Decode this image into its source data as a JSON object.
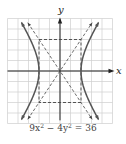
{
  "chart_data": {
    "type": "line",
    "title": "",
    "caption": "9x² − 4y² = 36",
    "caption_parts": {
      "a": "9x",
      "sup1": "2",
      "b": " − 4y",
      "sup2": "2",
      "c": " = 36"
    },
    "xlabel": "x",
    "ylabel": "y",
    "xlim": [
      -5,
      5
    ],
    "ylim": [
      -5,
      5
    ],
    "grid": true,
    "grid_step": 1,
    "series": [
      {
        "name": "hyperbola right branch",
        "style": "solid",
        "equation": "x^2/4 - y^2/9 = 1, x>0",
        "vertex": [
          2,
          0
        ]
      },
      {
        "name": "hyperbola left branch",
        "style": "solid",
        "equation": "x^2/4 - y^2/9 = 1, x<0",
        "vertex": [
          -2,
          0
        ]
      },
      {
        "name": "asymptote",
        "style": "dashed",
        "equation": "y = 1.5x"
      },
      {
        "name": "asymptote",
        "style": "dashed",
        "equation": "y = -1.5x"
      },
      {
        "name": "fundamental rectangle",
        "style": "dashed",
        "corners": [
          [
            -2,
            3
          ],
          [
            2,
            3
          ],
          [
            2,
            -3
          ],
          [
            -2,
            -3
          ]
        ]
      }
    ]
  },
  "colors": {
    "curve": "#555555",
    "grid": "#cfcfcf",
    "axis": "#222222",
    "dash": "#444444"
  }
}
